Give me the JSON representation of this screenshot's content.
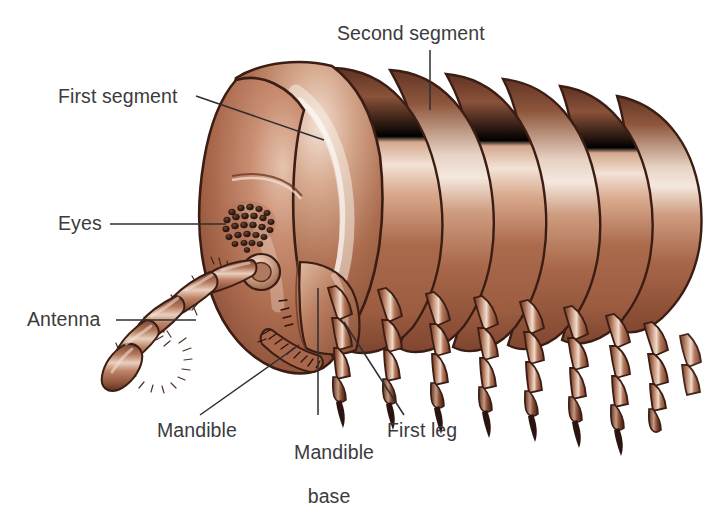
{
  "figure": {
    "background_color": "#ffffff",
    "text_color": "#3b3b3d",
    "body_colors": {
      "dark_outline": "#3b1d14",
      "deep_shadow": "#5a2e20",
      "mid_brown": "#9c5e45",
      "base_brown": "#a9684d",
      "warm_brown": "#b87a5c",
      "highlight": "#e8cbba",
      "specular": "#f5e6dc",
      "claw_dark": "#2a1410"
    }
  },
  "labels": [
    {
      "id": "first-segment",
      "text": "First segment",
      "leader": "diagonal-right-down"
    },
    {
      "id": "second-segment",
      "text": "Second segment",
      "leader": "vertical-down"
    },
    {
      "id": "eyes",
      "text": "Eyes",
      "leader": "horizontal-right"
    },
    {
      "id": "antenna",
      "text": "Antenna",
      "leader": "horizontal-right"
    },
    {
      "id": "mandible",
      "text": "Mandible",
      "leader": "diagonal-up-left"
    },
    {
      "id": "mandible-base",
      "text": "Mandible",
      "text2": "base",
      "leader": "vertical-up"
    },
    {
      "id": "first-leg",
      "text": "First leg",
      "leader": "diagonal-up-left"
    }
  ],
  "anatomy": {
    "eye_ommatidia_count": 27,
    "antenna_segments": 5,
    "body_segments_visible": 7,
    "legs_visible": 9
  }
}
